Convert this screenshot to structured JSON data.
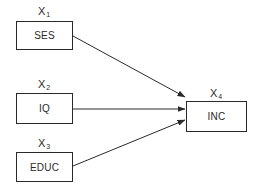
{
  "diagram": {
    "type": "path-diagram",
    "nodes": [
      {
        "id": "x1",
        "variable": "X",
        "subscript": "1",
        "label": "SES"
      },
      {
        "id": "x2",
        "variable": "X",
        "subscript": "2",
        "label": "IQ"
      },
      {
        "id": "x3",
        "variable": "X",
        "subscript": "3",
        "label": "EDUC"
      },
      {
        "id": "x4",
        "variable": "X",
        "subscript": "4",
        "label": "INC"
      }
    ],
    "edges": [
      {
        "from": "x1",
        "to": "x4"
      },
      {
        "from": "x2",
        "to": "x4"
      },
      {
        "from": "x3",
        "to": "x4"
      }
    ],
    "line_color": "#2a2a2a"
  }
}
